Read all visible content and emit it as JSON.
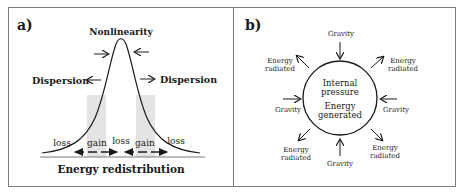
{
  "panel_a": {
    "label": "a)",
    "top_label": "Nonlinearity",
    "left_label": "Dispersion",
    "right_label": "Dispersion",
    "bottom_labels": [
      "loss",
      "gain",
      "loss",
      "gain",
      "loss"
    ],
    "caption": "Energy redistribution",
    "shade_color": "#e4e4e4"
  },
  "panel_b": {
    "label": "b)",
    "center_lines": [
      "Internal",
      "pressure",
      "Energy",
      "generated"
    ],
    "gravity_label": "Gravity",
    "energy_label_line1": "Energy",
    "energy_label_line2": "radiated"
  },
  "colors": {
    "border": "#7a7a7a",
    "ink": "#1a1a1a"
  }
}
